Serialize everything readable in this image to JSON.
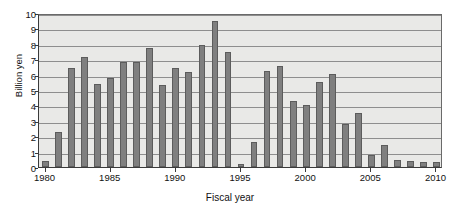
{
  "chart_data": {
    "type": "bar",
    "title": "",
    "xlabel": "Fiscal year",
    "ylabel": "Billion yen",
    "ylim": [
      0,
      10
    ],
    "ytick_labels": [
      "0",
      "1",
      "2",
      "3",
      "4",
      "5",
      "6",
      "7",
      "8",
      "9",
      "10"
    ],
    "ytick_values": [
      0,
      1,
      2,
      3,
      4,
      5,
      6,
      7,
      8,
      9,
      10
    ],
    "xtick_labels": [
      "1980",
      "1985",
      "1990",
      "1995",
      "2000",
      "2005",
      "2010"
    ],
    "xtick_values": [
      1980,
      1985,
      1990,
      1995,
      2000,
      2005,
      2010
    ],
    "grid": true,
    "legend": "none",
    "bar_color": "#7f7f7f",
    "bar_edge_color": "#5c5c5c",
    "plot_background": "#e9e9e7",
    "axis_color": "#3a3a3a",
    "categories": [
      "1980",
      "1981",
      "1982",
      "1983",
      "1984",
      "1985",
      "1986",
      "1987",
      "1988",
      "1989",
      "1990",
      "1991",
      "1992",
      "1993",
      "1994",
      "1995",
      "1996",
      "1997",
      "1998",
      "1999",
      "2000",
      "2001",
      "2002",
      "2003",
      "2004",
      "2005",
      "2006",
      "2007",
      "2008",
      "2009",
      "2010"
    ],
    "values": [
      0.4,
      2.3,
      6.45,
      7.15,
      5.4,
      5.75,
      6.8,
      6.85,
      7.7,
      5.35,
      6.45,
      6.2,
      7.95,
      9.45,
      7.45,
      0.2,
      1.65,
      6.25,
      6.55,
      4.3,
      4.05,
      5.5,
      6.05,
      2.8,
      3.5,
      0.75,
      1.4,
      0.45,
      0.4,
      0.35,
      0.35
    ]
  }
}
